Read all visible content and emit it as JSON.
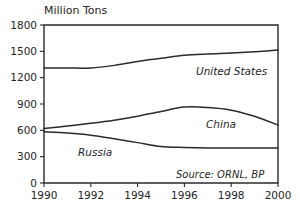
{
  "chart_data": {
    "type": "line",
    "title": "Million Tons",
    "xlabel": "",
    "ylabel": "Million Tons",
    "xlim": [
      1990,
      2000
    ],
    "ylim": [
      0,
      1800
    ],
    "grid": false,
    "legend_position": "inline-labels",
    "x": [
      1990,
      1991,
      1992,
      1993,
      1994,
      1995,
      1996,
      1997,
      1998,
      1999,
      2000
    ],
    "xticks": [
      "1990",
      "1992",
      "1994",
      "1996",
      "1998",
      "2000"
    ],
    "xtick_values": [
      1990,
      1992,
      1994,
      1996,
      1998,
      2000
    ],
    "yticks": [
      "0",
      "300",
      "600",
      "900",
      "1200",
      "1500",
      "1800"
    ],
    "ytick_values": [
      0,
      300,
      600,
      900,
      1200,
      1500,
      1800
    ],
    "series": [
      {
        "name": "United States",
        "values": [
          1310,
          1310,
          1310,
          1340,
          1385,
          1420,
          1455,
          1470,
          1480,
          1495,
          1515
        ]
      },
      {
        "name": "China",
        "values": [
          620,
          650,
          680,
          715,
          760,
          815,
          865,
          860,
          830,
          760,
          660
        ]
      },
      {
        "name": "Russia",
        "values": [
          585,
          570,
          545,
          505,
          460,
          415,
          405,
          400,
          398,
          400,
          400
        ]
      }
    ],
    "annotations": [
      {
        "name": "source-note",
        "text": "Source: ORNL, BP"
      }
    ]
  },
  "labels": {
    "title": "Million Tons",
    "united_states": "United States",
    "china": "China",
    "russia": "Russia",
    "source": "Source: ORNL, BP"
  }
}
